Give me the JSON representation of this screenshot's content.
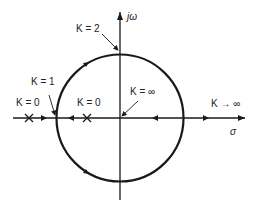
{
  "diagram": {
    "type": "root-locus",
    "axes": {
      "imaginary_label": "jω",
      "real_label": "σ"
    },
    "labels": {
      "k2": "K = 2",
      "k1": "K = 1",
      "k0_left": "K = 0",
      "k0_right": "K = 0",
      "kinf_center": "K = ∞",
      "kinf_right": "K → ∞"
    },
    "poles": [
      {
        "name": "pole-1",
        "symbol": "×"
      },
      {
        "name": "pole-2",
        "symbol": "×"
      }
    ],
    "colors": {
      "stroke": "#1a1a1a",
      "background": "#ffffff"
    }
  }
}
